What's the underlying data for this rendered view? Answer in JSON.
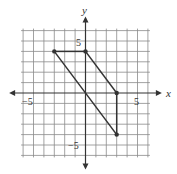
{
  "chart_data": {
    "type": "scatter",
    "title": "",
    "xlabel": "x",
    "ylabel": "y",
    "xlim": [
      -6,
      6
    ],
    "ylim": [
      -6,
      6
    ],
    "grid": true,
    "grid_step": 1,
    "tick_labels": {
      "x": [
        {
          "value": -5,
          "label": "−5"
        },
        {
          "value": 5,
          "label": "5"
        }
      ],
      "y": [
        {
          "value": 5,
          "label": "5"
        },
        {
          "value": -5,
          "label": "−5"
        }
      ]
    },
    "polygon": {
      "name": "parallelogram",
      "vertices": [
        [
          -3,
          4
        ],
        [
          0,
          4
        ],
        [
          3,
          0
        ],
        [
          3,
          -4
        ]
      ],
      "edges": [
        [
          [
            -3,
            4
          ],
          [
            0,
            4
          ]
        ],
        [
          [
            0,
            4
          ],
          [
            3,
            0
          ]
        ],
        [
          [
            3,
            0
          ],
          [
            3,
            -4
          ]
        ],
        [
          [
            3,
            -4
          ],
          [
            -3,
            4
          ]
        ]
      ]
    },
    "colors": {
      "grid": "#8a8a8a",
      "axis": "#333333",
      "figure": "#333333"
    }
  }
}
